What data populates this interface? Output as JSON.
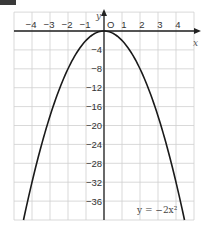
{
  "corner_tag": "",
  "chart_data": {
    "type": "line",
    "title": "",
    "function": "y = -2x^2",
    "series": [
      {
        "name": "y = −2x²",
        "x": [
          -4.5,
          -4,
          -3,
          -2,
          -1,
          0,
          1,
          2,
          3,
          4,
          4.5
        ],
        "y": [
          -40.5,
          -32,
          -18,
          -8,
          -2,
          0,
          -2,
          -8,
          -18,
          -32,
          -40.5
        ]
      }
    ],
    "xlabel": "x",
    "ylabel": "y",
    "origin_label": "O",
    "xlim": [
      -5,
      5
    ],
    "ylim": [
      -40,
      4
    ],
    "x_ticks": [
      "−4",
      "−3",
      "−2",
      "−1",
      "1",
      "2",
      "3",
      "4"
    ],
    "y_ticks": [
      "−4",
      "−8",
      "−12",
      "−16",
      "−20",
      "−24",
      "−28",
      "−32",
      "−36"
    ],
    "grid": true,
    "annotation": "y = −2x²",
    "colors": {
      "curve": "#1a1a1a",
      "grid": "#cfcfcf",
      "axis": "#222222"
    }
  }
}
